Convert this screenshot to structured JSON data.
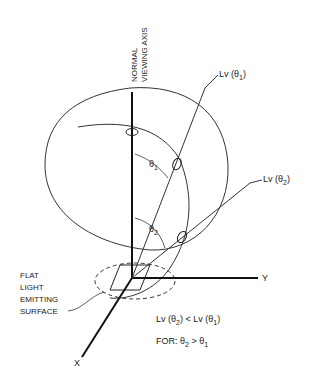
{
  "diagram": {
    "axis_label_line1": "NORMAL",
    "axis_label_line2": "VIEWING AXIS",
    "lv_theta1": "Lv (θ",
    "lv_theta1_sub": "1",
    "lv_theta2": "Lv (θ",
    "lv_theta2_sub": "2",
    "theta": "θ",
    "sub1": "1",
    "sub2": "2",
    "axis_x": "X",
    "axis_y": "Y",
    "surface_label": [
      "FLAT",
      "LIGHT",
      "EMITTING",
      "SURFACE"
    ],
    "relation_lhs": "Lv (θ",
    "relation_op": "<",
    "for_label": "FOR:",
    "for_op": ">"
  }
}
